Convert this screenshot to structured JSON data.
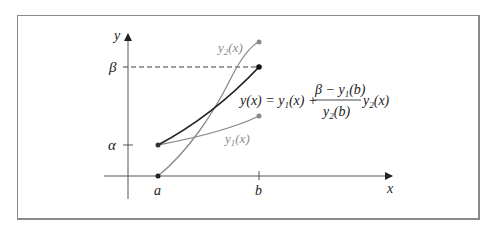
{
  "diagram": {
    "axes": {
      "x_label": "x",
      "y_label": "y"
    },
    "x_ticks": [
      {
        "label": "a",
        "x": 158
      },
      {
        "label": "b",
        "x": 259
      }
    ],
    "y_ticks": [
      {
        "label": "β",
        "y": 67
      },
      {
        "label": "α",
        "y": 145
      }
    ],
    "curves": [
      {
        "name": "y1(x)",
        "label_main": "y",
        "label_sub": "1",
        "label_rest": "(x)",
        "start": [
          158,
          145
        ],
        "end": [
          259,
          116
        ],
        "color": "#8a8a8a"
      },
      {
        "name": "y2(x)",
        "label_main": "y",
        "label_sub": "2",
        "label_rest": "(x)",
        "start": [
          158,
          176
        ],
        "end": [
          259,
          42
        ],
        "color": "#8a8a8a"
      },
      {
        "name": "y(x)",
        "start": [
          158,
          145
        ],
        "end": [
          259,
          67
        ],
        "color": "#222222"
      }
    ],
    "formula": {
      "lhs": "y(x) = y",
      "lhs_sub": "1",
      "lhs_rest": "(x) +",
      "numerator": "β − y",
      "numerator_sub": "1",
      "numerator_rest": "(b)",
      "denominator": "y",
      "denominator_sub": "2",
      "denominator_rest": "(b)",
      "trail": "y",
      "trail_sub": "2",
      "trail_rest": "(x)"
    },
    "colors": {
      "frame": "#8a8a8a",
      "axis": "#555555",
      "solution": "#222222",
      "basis": "#8a8a8a"
    }
  }
}
